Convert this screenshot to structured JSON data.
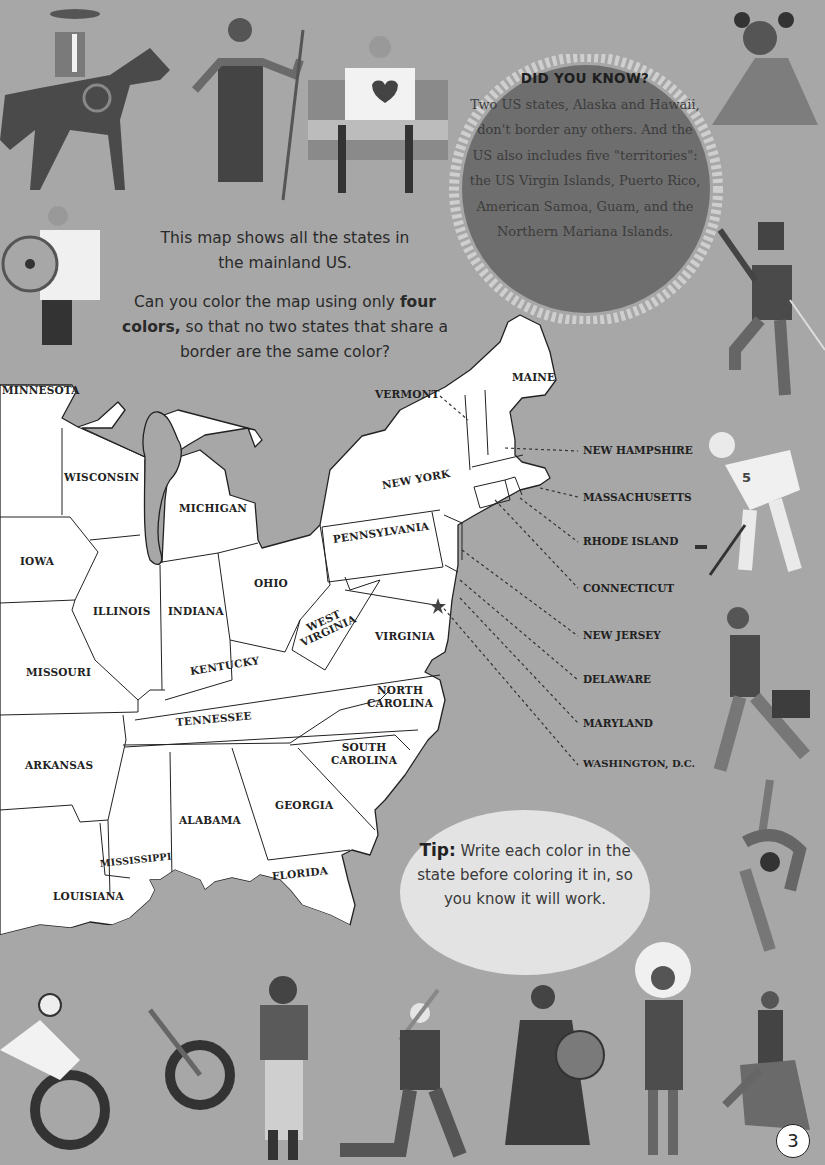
{
  "intro": {
    "line1": "This map shows all the states in the mainland US.",
    "question_prefix": "Can you color the map using only",
    "question_bold": "four colors,",
    "question_suffix": "so that no two states that share a border are the same color?"
  },
  "did_you_know": {
    "title": "DID YOU KNOW?",
    "body": "Two US states, Alaska and Hawaii, don't border any others. And the US also includes five \"territories\": the US Virgin Islands, Puerto Rico, American Samoa, Guam, and the Northern Mariana Islands."
  },
  "tip": {
    "label": "Tip:",
    "text": "Write each color in the state before coloring it in, so you know it will work."
  },
  "map": {
    "states": [
      {
        "name": "MINNESOTA"
      },
      {
        "name": "WISCONSIN"
      },
      {
        "name": "MICHIGAN"
      },
      {
        "name": "IOWA"
      },
      {
        "name": "ILLINOIS"
      },
      {
        "name": "INDIANA"
      },
      {
        "name": "OHIO"
      },
      {
        "name": "PENNSYLVANIA"
      },
      {
        "name": "NEW YORK"
      },
      {
        "name": "MAINE"
      },
      {
        "name": "VERMONT"
      },
      {
        "name": "WEST VIRGINIA"
      },
      {
        "name": "VIRGINIA"
      },
      {
        "name": "KENTUCKY"
      },
      {
        "name": "MISSOURI"
      },
      {
        "name": "TENNESSEE"
      },
      {
        "name": "NORTH CAROLINA"
      },
      {
        "name": "SOUTH CAROLINA"
      },
      {
        "name": "ARKANSAS"
      },
      {
        "name": "GEORGIA"
      },
      {
        "name": "ALABAMA"
      },
      {
        "name": "MISSISSIPPI"
      },
      {
        "name": "LOUISIANA"
      },
      {
        "name": "FLORIDA"
      }
    ],
    "callouts": [
      {
        "name": "NEW HAMPSHIRE"
      },
      {
        "name": "MASSACHUSETTS"
      },
      {
        "name": "RHODE ISLAND"
      },
      {
        "name": "CONNECTICUT"
      },
      {
        "name": "NEW JERSEY"
      },
      {
        "name": "DELAWARE"
      },
      {
        "name": "MARYLAND"
      },
      {
        "name": "WASHINGTON, D.C."
      }
    ],
    "capital_marker": "star-icon"
  },
  "illustrations": [
    "cowboy-on-horse",
    "woman-with-spear",
    "man-in-wheelchair-with-flag",
    "woman-with-hair-buns",
    "man-with-shield",
    "dancer-with-sword",
    "hockey-player-5",
    "businessman-with-briefcase",
    "figure-skater",
    "motorcycle-rider",
    "woman-with-ukulele",
    "baseball-batter",
    "drummer",
    "chief-with-headdress",
    "powwow-dancer"
  ],
  "hockey_number": "5",
  "page_number": "3",
  "colors": {
    "background": "#a7a7a7",
    "land": "#ffffff",
    "water": "#a7a7a7",
    "dyk_circle": "#6e6e6e",
    "tip_bubble": "#e3e3e3",
    "text": "#222222"
  }
}
